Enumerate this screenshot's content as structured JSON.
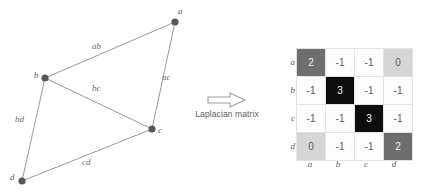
{
  "graph": {
    "nodes": [
      {
        "id": "a",
        "label": "a",
        "x": 175,
        "y": 22,
        "label_x": 178,
        "label_y": 6
      },
      {
        "id": "b",
        "label": "b",
        "x": 45,
        "y": 78,
        "label_x": 34,
        "label_y": 70
      },
      {
        "id": "c",
        "label": "c",
        "x": 152,
        "y": 129,
        "label_x": 158,
        "label_y": 125
      },
      {
        "id": "d",
        "label": "d",
        "x": 22,
        "y": 181,
        "label_x": 10,
        "label_y": 172
      }
    ],
    "edges": [
      {
        "id": "ab",
        "label": "ab",
        "from": "a",
        "to": "b",
        "label_x": 92,
        "label_y": 41
      },
      {
        "id": "ac",
        "label": "ac",
        "from": "a",
        "to": "c",
        "label_x": 162,
        "label_y": 72
      },
      {
        "id": "bc",
        "label": "bc",
        "from": "b",
        "to": "c",
        "label_x": 92,
        "label_y": 83
      },
      {
        "id": "bd",
        "label": "bd",
        "from": "b",
        "to": "d",
        "label_x": 15,
        "label_y": 114
      },
      {
        "id": "cd",
        "label": "cd",
        "from": "c",
        "to": "d",
        "label_x": 82,
        "label_y": 157
      }
    ],
    "node_color": "#585858",
    "edge_color": "#9a9a9a"
  },
  "transform": {
    "caption": "Laplacian matrix",
    "arrow_icon": "right-arrow-outline-icon"
  },
  "matrix": {
    "row_labels": [
      "a",
      "b",
      "c",
      "d"
    ],
    "col_labels": [
      "a",
      "b",
      "c",
      "d"
    ],
    "rows": [
      [
        {
          "value": "2",
          "style": "dark"
        },
        {
          "value": "-1",
          "style": "white"
        },
        {
          "value": "-1",
          "style": "white"
        },
        {
          "value": "0",
          "style": "light"
        }
      ],
      [
        {
          "value": "-1",
          "style": "white"
        },
        {
          "value": "3",
          "style": "black"
        },
        {
          "value": "-1",
          "style": "white"
        },
        {
          "value": "-1",
          "style": "white"
        }
      ],
      [
        {
          "value": "-1",
          "style": "white"
        },
        {
          "value": "-1",
          "style": "white"
        },
        {
          "value": "3",
          "style": "black"
        },
        {
          "value": "-1",
          "style": "white"
        }
      ],
      [
        {
          "value": "0",
          "style": "light"
        },
        {
          "value": "-1",
          "style": "white"
        },
        {
          "value": "-1",
          "style": "white"
        },
        {
          "value": "2",
          "style": "dark"
        }
      ]
    ],
    "colors": {
      "white": "#fdfdfd",
      "black": "#0d0d0d",
      "dark": "#6e6e6e",
      "light": "#d6d6d6",
      "gridline": "#e2e2e2"
    }
  }
}
